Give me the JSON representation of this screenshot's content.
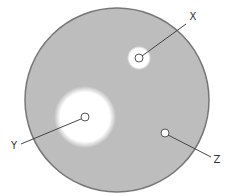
{
  "diagram": {
    "type": "petri-dish-zones-of-inhibition",
    "colors": {
      "background": "#ffffff",
      "agar": "#bdbdbd",
      "dish_rim": "#777777",
      "clear_zone": "#ffffff",
      "disc_stroke": "#555555",
      "leader_line": "#444444",
      "label": "#333333"
    },
    "dish": {
      "cx": 117,
      "cy": 100,
      "r": 92
    },
    "discs": [
      {
        "id": "X",
        "label": "X",
        "cx": 139,
        "cy": 58,
        "disc_r": 4,
        "zone_r": 12,
        "label_x": 193,
        "label_y": 20,
        "line": {
          "x1": 142,
          "y1": 56,
          "x2": 186,
          "y2": 24
        }
      },
      {
        "id": "Y",
        "label": "Y",
        "cx": 85,
        "cy": 117,
        "disc_r": 4,
        "zone_r": 31,
        "label_x": 14,
        "label_y": 149,
        "line": {
          "x1": 81,
          "y1": 119,
          "x2": 21,
          "y2": 144
        }
      },
      {
        "id": "Z",
        "label": "Z",
        "cx": 165,
        "cy": 133,
        "disc_r": 4,
        "zone_r": 0,
        "label_x": 217,
        "label_y": 163,
        "line": {
          "x1": 168,
          "y1": 135,
          "x2": 211,
          "y2": 157
        }
      }
    ]
  }
}
